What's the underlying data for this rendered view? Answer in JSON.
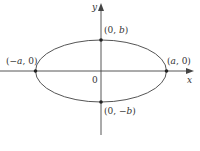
{
  "diagram": {
    "type": "ellipse",
    "colors": {
      "curve": "#555555",
      "axis": "#444444",
      "point": "#222222",
      "text": "#333333"
    },
    "axes": {
      "x_label": "x",
      "y_label": "y",
      "origin_label": "0"
    },
    "points": [
      {
        "id": "top",
        "paren_open": "(",
        "coord1": "0",
        "sep": ", ",
        "coord2": "b",
        "paren_close": ")"
      },
      {
        "id": "bottom",
        "paren_open": "(",
        "coord1": "0",
        "sep": ", ",
        "coord2": "−b",
        "paren_close": ")"
      },
      {
        "id": "left",
        "paren_open": "(",
        "coord1": "−a",
        "sep": ", ",
        "coord2": "0",
        "paren_close": ")"
      },
      {
        "id": "right",
        "paren_open": "(",
        "coord1": "a",
        "sep": ", ",
        "coord2": "0",
        "paren_close": ")"
      }
    ]
  }
}
